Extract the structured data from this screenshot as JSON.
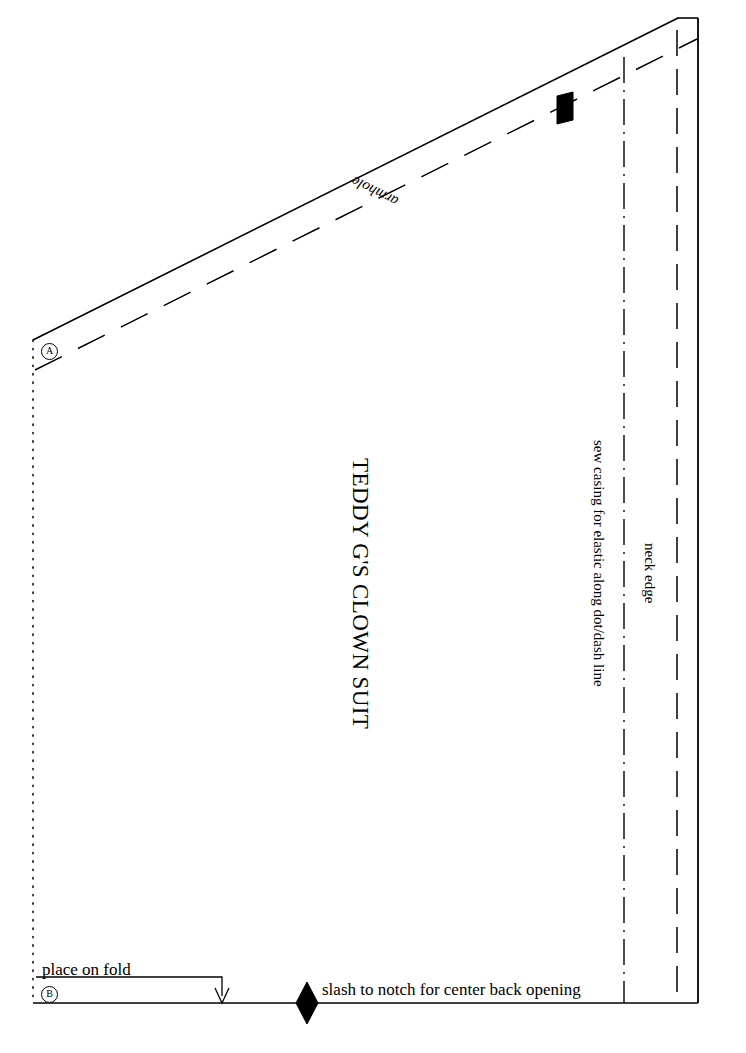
{
  "document": {
    "title": "TEDDY G'S CLOWN SUIT",
    "kind": "sewing-pattern-piece"
  },
  "labels": {
    "title": "TEDDY G'S CLOWN SUIT",
    "armhole": "armhole",
    "sew_casing": "sew casing for elastic along dot/dash line",
    "neck_edge": "neck edge",
    "place_on_fold": "place on fold",
    "slash_to_notch": "slash to notch for center back opening",
    "marker_a": "A",
    "marker_b": "B"
  },
  "colors": {
    "ink": "#000000",
    "paper": "#ffffff"
  },
  "geometry": {
    "canvas": {
      "width": 746,
      "height": 1053
    },
    "cut_outline": {
      "description": "solid cutting line",
      "points": "33,340 678,18 698,18 698,1003 33,1003"
    },
    "fold_edge": {
      "description": "place-on-fold dotted left edge",
      "x": 33,
      "y_top": 340,
      "y_bottom": 1003,
      "style": "dotted"
    },
    "armhole_seamline": {
      "description": "long-dashed armhole stitching line",
      "x1": 35,
      "y1": 370,
      "x2": 697,
      "y2": 39,
      "style": "dashed"
    },
    "casing_line": {
      "description": "vertical dot-dash line for elastic casing",
      "x": 624,
      "y_top": 57,
      "y_bottom": 1003,
      "style": "dash-dot"
    },
    "neck_edge_line": {
      "description": "vertical dashed neck edge line",
      "x": 677,
      "y_top": 30,
      "y_bottom": 1003,
      "style": "dashed"
    },
    "fold_arrow": {
      "description": "bracket with downward arrow indicating fold placement",
      "x_left": 36,
      "x_right": 222,
      "y_top": 977,
      "y_arrow_tip": 1003
    },
    "notch_armhole": {
      "cx": 565,
      "cy": 108,
      "shape": "parallelogram"
    },
    "notch_center_back": {
      "cx": 307,
      "cy": 1003,
      "shape": "diamond"
    },
    "marker_a_pos": {
      "x": 47,
      "y": 350
    },
    "marker_b_pos": {
      "x": 48,
      "y": 992
    }
  }
}
